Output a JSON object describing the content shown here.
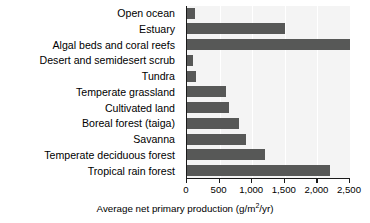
{
  "chart_data": {
    "type": "bar",
    "orientation": "horizontal",
    "title": "",
    "xlabel": "Average net primary production (g/m2/yr)",
    "xlabel_parts": {
      "before": "Average net primary production (g/m",
      "exponent": "2",
      "after": "/yr)"
    },
    "ylabel": "",
    "xlim": [
      0,
      2500
    ],
    "xticks": [
      0,
      500,
      1000,
      1500,
      2000,
      2500
    ],
    "xtick_labels": [
      "0",
      "500",
      "1,000",
      "1,500",
      "2,000",
      "2,500"
    ],
    "grid": true,
    "grid_axis": "x",
    "legend": false,
    "bar_color": "#575857",
    "plot_background": "#f4f4f4",
    "axis_color": "#1a1a1a",
    "categories": [
      "Open ocean",
      "Estuary",
      "Algal beds and coral reefs",
      "Desert and semidesert scrub",
      "Tundra",
      "Temperate grassland",
      "Cultivated land",
      "Boreal forest (taiga)",
      "Savanna",
      "Temperate deciduous forest",
      "Tropical rain forest"
    ],
    "values": [
      125,
      1500,
      2500,
      90,
      140,
      600,
      650,
      800,
      900,
      1200,
      2200
    ]
  }
}
